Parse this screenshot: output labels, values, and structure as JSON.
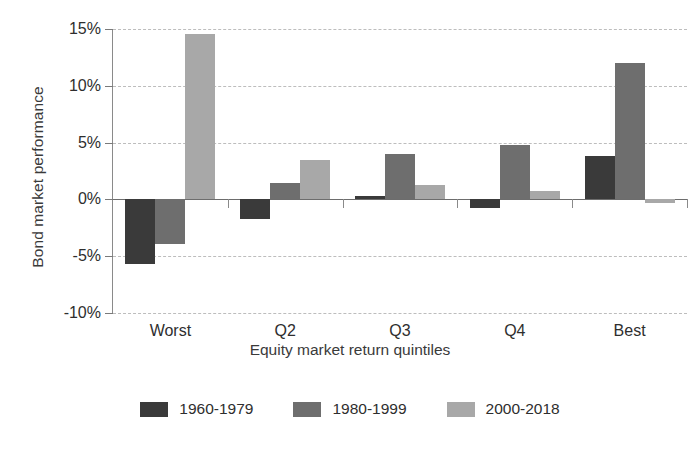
{
  "chart_data": {
    "type": "bar",
    "title": "",
    "xlabel": "Equity market return quintiles",
    "ylabel": "Bond market performance",
    "categories": [
      "Worst",
      "Q2",
      "Q3",
      "Q4",
      "Best"
    ],
    "ylim": [
      -10,
      15
    ],
    "yticks": [
      15,
      10,
      5,
      0,
      -5,
      -10
    ],
    "ytick_labels": [
      "15%",
      "10%",
      "5%",
      "0%",
      "-5%",
      "-10%"
    ],
    "grid": true,
    "legend_position": "bottom",
    "series": [
      {
        "name": "1960-1979",
        "color": "#3a3a3a",
        "values": [
          -5.7,
          -1.7,
          0.3,
          -0.8,
          3.8
        ]
      },
      {
        "name": "1980-1999",
        "color": "#6e6e6e",
        "values": [
          -3.9,
          1.4,
          4.0,
          4.8,
          12.0
        ]
      },
      {
        "name": "2000-2018",
        "color": "#a8a8a8",
        "values": [
          14.6,
          3.5,
          1.3,
          0.7,
          -0.3
        ]
      }
    ]
  }
}
